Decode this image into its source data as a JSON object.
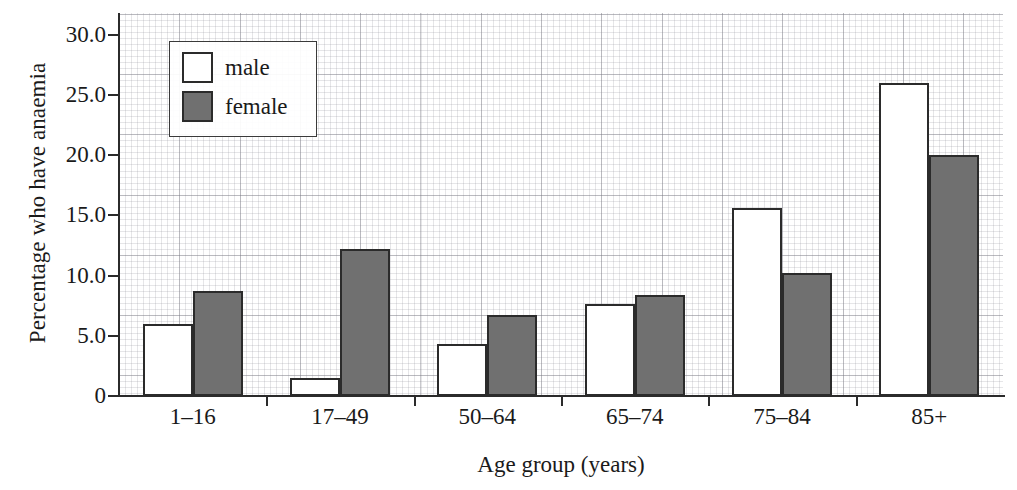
{
  "chart_data": {
    "type": "bar",
    "title": "",
    "xlabel": "Age group (years)",
    "ylabel": "Percentage who have anaemia",
    "categories": [
      "1–16",
      "17–49",
      "50–64",
      "65–74",
      "75–84",
      "85+"
    ],
    "series": [
      {
        "name": "male",
        "color": "#ffffff",
        "values": [
          6.0,
          1.5,
          4.3,
          7.6,
          15.6,
          26.0
        ]
      },
      {
        "name": "female",
        "color": "#707070",
        "values": [
          8.7,
          12.2,
          6.7,
          8.4,
          10.2,
          20.0
        ]
      }
    ],
    "ylim": [
      0,
      31.8
    ],
    "yticks": [
      0,
      5,
      10,
      15,
      20,
      25,
      30
    ],
    "ytick_labels": [
      "0",
      "5.0",
      "10.0",
      "15.0",
      "20.0",
      "25.0",
      "30.0"
    ],
    "grid": true,
    "grid_style": "graph-paper",
    "legend_position": "upper-left-inside"
  },
  "legend": {
    "entries": [
      {
        "label": "male"
      },
      {
        "label": "female"
      }
    ]
  },
  "axes": {
    "y_title": "Percentage who have anaemia",
    "x_title": "Age group (years)"
  }
}
